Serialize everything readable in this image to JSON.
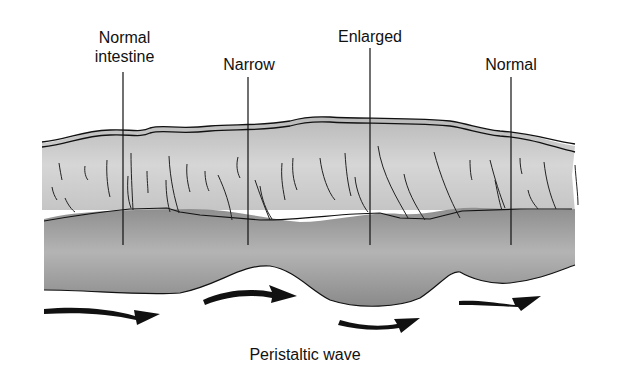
{
  "diagram": {
    "labels": {
      "normal_intestine_line1": "Normal",
      "normal_intestine_line2": "intestine",
      "narrow": "Narrow",
      "enlarged": "Enlarged",
      "normal": "Normal",
      "caption": "Peristaltic wave"
    },
    "colors": {
      "background": "#ffffff",
      "outer_wall": "#c8c8c8",
      "lumen": "#9a9a9a",
      "line": "#111111"
    }
  }
}
